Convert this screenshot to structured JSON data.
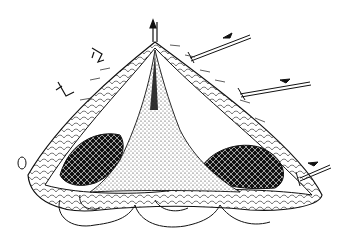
{
  "figure": {
    "type": "surgical-illustration",
    "style": "black-and-white line engraving",
    "background": "#ffffff",
    "ink": "#111111",
    "caption": ""
  },
  "elements": {
    "incision": {
      "shape": "triangular wound with apex at top",
      "apex": [
        155,
        42
      ],
      "base_left": [
        30,
        215
      ],
      "base_right": [
        320,
        205
      ]
    },
    "center_field": {
      "fill": "stippled",
      "description": "central stippled tissue wedge"
    },
    "muscle_left": {
      "fill": "dark cross-hatched",
      "description": "left exposed muscle belly"
    },
    "muscle_right": {
      "fill": "dark cross-hatched",
      "description": "right exposed muscle belly"
    },
    "bowel_loops": {
      "description": "intestinal loops visible beneath the incision"
    },
    "clamps": [
      {
        "position": [
          97,
          55
        ],
        "description": "small clamp/suture marker upper-left"
      },
      {
        "position": [
          67,
          93
        ],
        "description": "small clamp/suture marker left"
      },
      {
        "position": [
          20,
          165
        ],
        "description": "small oval marker far left"
      }
    ],
    "arrows": [
      {
        "position": [
          155,
          30
        ],
        "direction": "up",
        "description": "traction arrow at apex"
      },
      {
        "position": [
          225,
          48
        ],
        "direction": "right",
        "description": "upper-right traction arrow"
      },
      {
        "position": [
          280,
          88
        ],
        "direction": "right",
        "description": "mid-right traction arrow"
      },
      {
        "position": [
          315,
          170
        ],
        "direction": "right",
        "description": "lower-right traction arrow"
      }
    ]
  }
}
